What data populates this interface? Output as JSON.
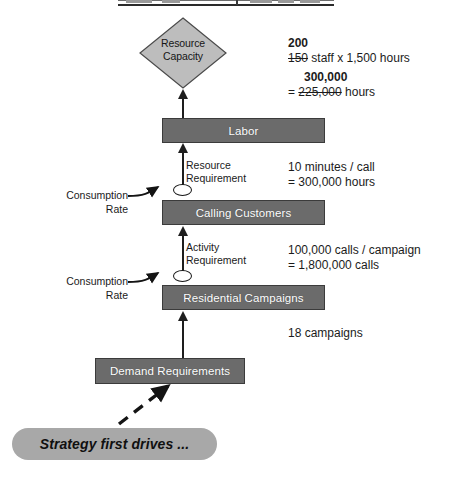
{
  "diagram": {
    "title_sliver": "",
    "resource_capacity": {
      "line1": "Resource",
      "line2": "Capacity"
    },
    "boxes": {
      "labor": "Labor",
      "calling_customers": "Calling Customers",
      "residential_campaigns": "Residential Campaigns",
      "demand_requirements": "Demand Requirements"
    },
    "flow_labels": {
      "resource_requirement_line1": "Resource",
      "resource_requirement_line2": "Requirement",
      "activity_requirement_line1": "Activity",
      "activity_requirement_line2": "Requirement"
    },
    "consumption_rate": {
      "line1": "Consumption",
      "line2": "Rate"
    },
    "annotations": {
      "capacity_staff_new": "200",
      "capacity_staff_old": "150",
      "capacity_staff_rest": " staff x 1,500 hours",
      "capacity_hours_new": "300,000",
      "capacity_hours_eq": "= ",
      "capacity_hours_old": "225,000",
      "capacity_hours_unit": " hours",
      "resource_rate": "10 minutes / call",
      "resource_total": "= 300,000 hours",
      "activity_rate": "100,000 calls / campaign",
      "activity_total": "= 1,800,000 calls",
      "demand_total": "18 campaigns"
    },
    "strategy_note": "Strategy first drives ...",
    "colors": {
      "box_fill": "#6b6b6b",
      "box_text": "#ffffff",
      "diamond_fill": "#bdbdbd",
      "pill_fill": "#a8a8a8",
      "arrow": "#1e1e1e",
      "background": "#ffffff"
    }
  }
}
